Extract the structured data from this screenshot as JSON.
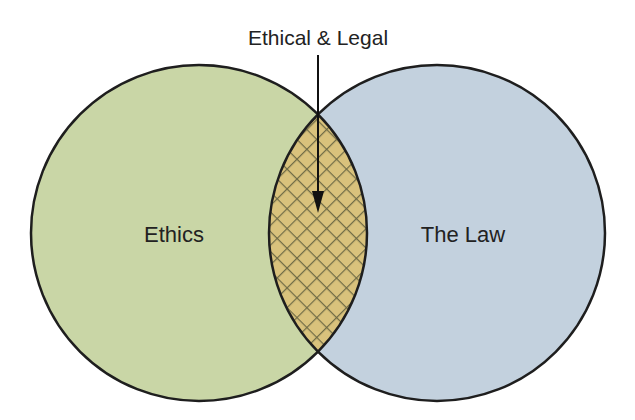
{
  "diagram": {
    "type": "venn",
    "title_annotation": "Ethical & Legal",
    "sets": [
      {
        "id": "ethics",
        "label": "Ethics",
        "color": "#c9d6a6"
      },
      {
        "id": "law",
        "label": "The Law",
        "color": "#c3d1de"
      }
    ],
    "intersection": {
      "label": "Ethical & Legal",
      "fill": "#d9c27c",
      "hatch_color": "#6e6a45"
    },
    "outline_color": "#1e1e1e"
  }
}
